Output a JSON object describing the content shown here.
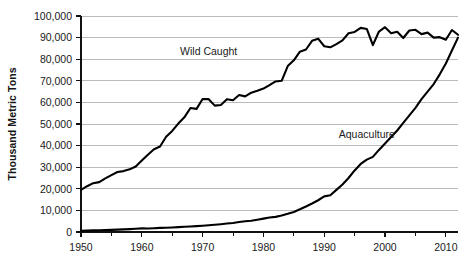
{
  "chart_data": {
    "type": "line",
    "title": "",
    "xlabel": "",
    "ylabel": "Thousand Metric Tons",
    "xlim": [
      1950,
      2012
    ],
    "ylim": [
      0,
      100000
    ],
    "grid": true,
    "legend_position": "inline-annotation",
    "y_ticks": [
      0,
      10000,
      20000,
      30000,
      40000,
      50000,
      60000,
      70000,
      80000,
      90000,
      100000
    ],
    "y_tick_labels": [
      "0",
      "10,000",
      "20,000",
      "30,000",
      "40,000",
      "50,000",
      "60,000",
      "70,000",
      "80,000",
      "90,000",
      "100,000"
    ],
    "x_ticks": [
      1950,
      1960,
      1970,
      1980,
      1990,
      2000,
      2010
    ],
    "x_tick_labels": [
      "1950",
      "1960",
      "1970",
      "1980",
      "1990",
      "2000",
      "2010"
    ],
    "x_minor_ticks": [
      1955,
      1965,
      1975,
      1985,
      1995,
      2005
    ],
    "x": [
      1950,
      1951,
      1952,
      1953,
      1954,
      1955,
      1956,
      1957,
      1958,
      1959,
      1960,
      1961,
      1962,
      1963,
      1964,
      1965,
      1966,
      1967,
      1968,
      1969,
      1970,
      1971,
      1972,
      1973,
      1974,
      1975,
      1976,
      1977,
      1978,
      1979,
      1980,
      1981,
      1982,
      1983,
      1984,
      1985,
      1986,
      1987,
      1988,
      1989,
      1990,
      1991,
      1992,
      1993,
      1994,
      1995,
      1996,
      1997,
      1998,
      1999,
      2000,
      2001,
      2002,
      2003,
      2004,
      2005,
      2006,
      2007,
      2008,
      2009,
      2010,
      2011,
      2012
    ],
    "series": [
      {
        "name": "Wild Caught",
        "color": "#000000",
        "label_x": 1971,
        "label_y": 82000,
        "values": [
          19500,
          21200,
          22600,
          23100,
          24800,
          26300,
          27800,
          28200,
          29000,
          30300,
          33100,
          35800,
          38300,
          39600,
          44100,
          46800,
          50200,
          53100,
          57400,
          57000,
          61600,
          61500,
          58500,
          58800,
          61500,
          61000,
          63400,
          62800,
          64500,
          65400,
          66400,
          68000,
          69700,
          70000,
          76800,
          79500,
          83500,
          84500,
          88500,
          89500,
          86000,
          85500,
          87000,
          88700,
          92000,
          92600,
          94500,
          94000,
          86500,
          92800,
          94800,
          92000,
          92700,
          89800,
          93300,
          93600,
          91600,
          92300,
          90000,
          90200,
          89000,
          93500,
          91300
        ]
      },
      {
        "name": "Aquaculture",
        "color": "#000000",
        "label_x": 1997,
        "label_y": 43500,
        "values": [
          600,
          700,
          750,
          800,
          900,
          1000,
          1100,
          1200,
          1350,
          1500,
          1700,
          1600,
          1750,
          1900,
          2000,
          2100,
          2250,
          2400,
          2550,
          2700,
          2900,
          3100,
          3350,
          3600,
          3900,
          4200,
          4600,
          5000,
          5200,
          5700,
          6200,
          6700,
          7000,
          7600,
          8400,
          9300,
          10500,
          11800,
          13200,
          14700,
          16500,
          17000,
          19500,
          22000,
          25000,
          28500,
          31500,
          33500,
          34800,
          38000,
          41000,
          44000,
          47000,
          50500,
          54000,
          57500,
          61500,
          65000,
          68500,
          73000,
          78000,
          84000,
          90000
        ]
      }
    ]
  }
}
